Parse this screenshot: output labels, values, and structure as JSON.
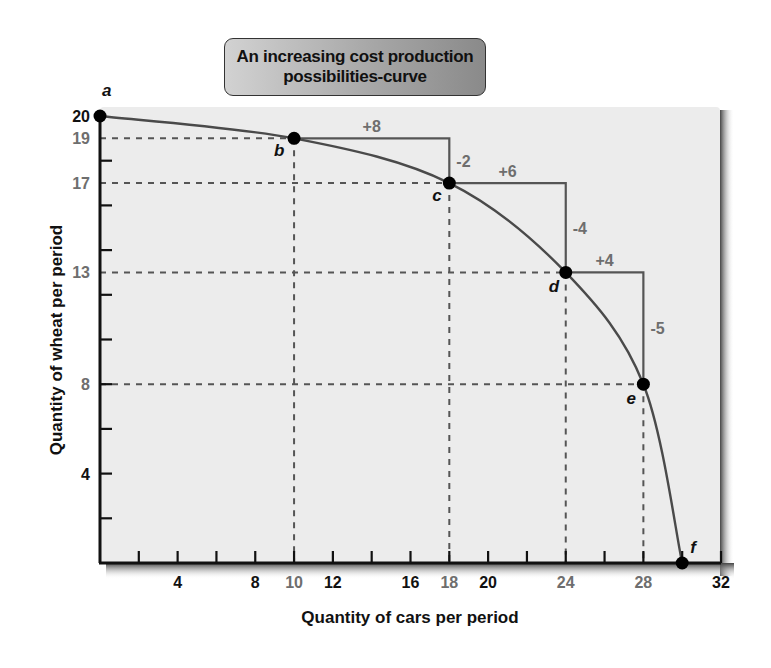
{
  "chart_data": {
    "type": "line",
    "title": "An increasing cost production possibilities-curve",
    "title_lines": [
      "An increasing cost production",
      "possibilities-curve"
    ],
    "xlabel": "Quantity of cars per period",
    "ylabel": "Quantity of wheat per period",
    "xlim": [
      0,
      32
    ],
    "ylim": [
      0,
      20
    ],
    "grid": false,
    "legend": null,
    "x_ticks_minor_step": 2,
    "y_ticks_minor_step": 2,
    "x_tick_labels": [
      {
        "value": 4,
        "label": "4",
        "highlight": false
      },
      {
        "value": 8,
        "label": "8",
        "highlight": false
      },
      {
        "value": 10,
        "label": "10",
        "highlight": true
      },
      {
        "value": 12,
        "label": "12",
        "highlight": false
      },
      {
        "value": 16,
        "label": "16",
        "highlight": false
      },
      {
        "value": 18,
        "label": "18",
        "highlight": true
      },
      {
        "value": 20,
        "label": "20",
        "highlight": false
      },
      {
        "value": 24,
        "label": "24",
        "highlight": true
      },
      {
        "value": 28,
        "label": "28",
        "highlight": true
      },
      {
        "value": 32,
        "label": "32",
        "highlight": false
      }
    ],
    "y_tick_labels": [
      {
        "value": 20,
        "label": "20",
        "highlight": false
      },
      {
        "value": 19,
        "label": "19",
        "highlight": true
      },
      {
        "value": 17,
        "label": "17",
        "highlight": true
      },
      {
        "value": 13,
        "label": "13",
        "highlight": true
      },
      {
        "value": 8,
        "label": "8",
        "highlight": true
      },
      {
        "value": 4,
        "label": "4",
        "highlight": false
      }
    ],
    "series": [
      {
        "name": "Production possibilities curve",
        "points": [
          {
            "label": "a",
            "x": 0,
            "y": 20
          },
          {
            "label": "b",
            "x": 10,
            "y": 19
          },
          {
            "label": "c",
            "x": 18,
            "y": 17
          },
          {
            "label": "d",
            "x": 24,
            "y": 13
          },
          {
            "label": "e",
            "x": 28,
            "y": 8
          },
          {
            "label": "f",
            "x": 30,
            "y": 0
          }
        ]
      }
    ],
    "annotations": [
      {
        "from": "b",
        "to": "c",
        "dx_label": "+8",
        "dy_label": "-2"
      },
      {
        "from": "c",
        "to": "d",
        "dx_label": "+6",
        "dy_label": "-4"
      },
      {
        "from": "d",
        "to": "e",
        "dx_label": "+4",
        "dy_label": "-5"
      }
    ],
    "dashed_guides": [
      {
        "x": 10,
        "y": 19
      },
      {
        "x": 18,
        "y": 17
      },
      {
        "x": 24,
        "y": 13
      },
      {
        "x": 28,
        "y": 8
      }
    ]
  },
  "colors": {
    "plot_bg": "#ececec",
    "axis": "#111111",
    "curve": "#4a4a4a",
    "highlight_label": "#6e6e6e",
    "step_line": "#555555",
    "dash": "#555555",
    "point": "#000000"
  }
}
